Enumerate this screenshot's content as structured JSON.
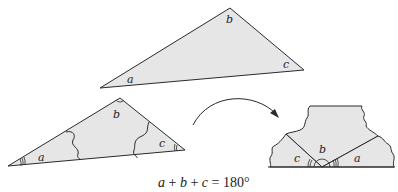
{
  "diagram": {
    "colors": {
      "fill": "#e6e6e6",
      "stroke": "#2a2a2a",
      "background": "#ffffff"
    },
    "top_triangle": {
      "angle_labels": {
        "a": "a",
        "b": "b",
        "c": "c"
      }
    },
    "cut_triangle": {
      "angle_labels": {
        "a": "a",
        "b": "b",
        "c": "c"
      }
    },
    "rearranged": {
      "angle_labels": {
        "a": "a",
        "b": "b",
        "c": "c"
      }
    },
    "equation": {
      "a": "a",
      "plus1": " + ",
      "b": "b",
      "plus2": " + ",
      "c": "c",
      "equals": " = ",
      "value": "180°"
    }
  }
}
